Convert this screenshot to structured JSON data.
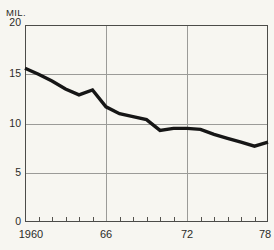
{
  "window": {
    "width": 274,
    "height": 250,
    "background": "#f7f6f1"
  },
  "chart_data": {
    "type": "line",
    "title": "",
    "unit_label": "MIL.",
    "xlabel": "",
    "ylabel": "MIL.",
    "x": [
      1960,
      1961,
      1962,
      1963,
      1964,
      1965,
      1966,
      1967,
      1968,
      1969,
      1970,
      1971,
      1972,
      1973,
      1974,
      1975,
      1976,
      1977,
      1978
    ],
    "values": [
      15.6,
      15.0,
      14.3,
      13.5,
      12.9,
      13.4,
      11.7,
      11.0,
      10.7,
      10.4,
      9.3,
      9.5,
      9.5,
      9.4,
      8.9,
      8.5,
      8.1,
      7.7,
      8.1
    ],
    "xlim": [
      1960,
      1978
    ],
    "ylim": [
      0,
      20
    ],
    "y_ticks": [
      0,
      5,
      10,
      15,
      20
    ],
    "y_tick_labels": [
      "20",
      "15",
      "10",
      "5",
      "0"
    ],
    "x_tick_labels": [
      {
        "x": 1960,
        "label": "1960"
      },
      {
        "x": 1966,
        "label": "66"
      },
      {
        "x": 1972,
        "label": "72"
      },
      {
        "x": 1978,
        "label": "78"
      }
    ],
    "x_minor_tick_step": 1,
    "grid_horizontal_at": [
      5,
      10,
      15
    ],
    "grid_vertical_at": [
      1966,
      1972
    ],
    "legend": null,
    "colors": {
      "line": "#161616",
      "grid": "#9b9b98",
      "axis": "#4c4c49",
      "tick": "#55534e",
      "background": "#f7f6f1",
      "label": "#2b2b28"
    }
  }
}
